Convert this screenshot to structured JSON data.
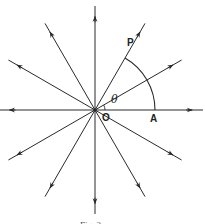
{
  "diagram": {
    "type": "radial-lines-with-arc",
    "ray_count": 12,
    "ray_angles_deg": [
      0,
      30,
      60,
      90,
      120,
      150,
      180,
      210,
      240,
      270,
      300,
      330
    ],
    "arc": {
      "from_angle_deg": 0,
      "to_angle_deg": 60
    },
    "angle_marker": {
      "from_angle_deg": 0,
      "to_angle_deg": 30
    },
    "labels": {
      "origin": "O",
      "point_p": "P",
      "point_a": "A",
      "angle": "θ"
    },
    "caption": "Fig. 2",
    "line_color": "#2a2a2a"
  }
}
